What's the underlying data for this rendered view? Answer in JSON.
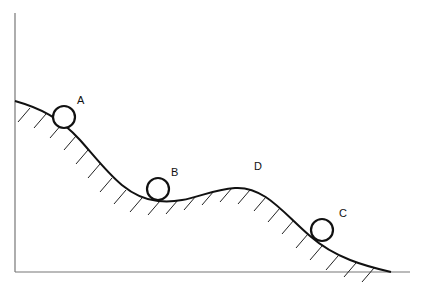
{
  "diagram": {
    "type": "potential-energy-curve",
    "colors": {
      "line": "#111111",
      "axis": "#777777",
      "background": "#ffffff"
    },
    "axes": {
      "vertical": "unlabeled",
      "horizontal": "unlabeled"
    },
    "points": [
      {
        "label": "A",
        "position": "on left slope"
      },
      {
        "label": "B",
        "position": "in valley"
      },
      {
        "label": "C",
        "position": "on right slope"
      },
      {
        "label": "D",
        "position": "hill top (no ball)"
      }
    ]
  }
}
